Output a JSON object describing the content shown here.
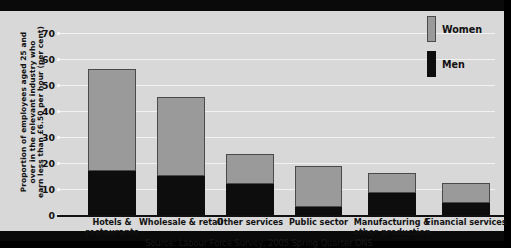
{
  "chart_data": {
    "type": "bar",
    "subtype": "stacked-bar",
    "title": "",
    "xlabel": "",
    "ylabel": "Proportion of employees aged 25 and\nover in the relevant industry who\nearn less than £6.50 per hour (per cent)",
    "ylim": [
      0,
      70
    ],
    "yticks": [
      0,
      10,
      20,
      30,
      40,
      50,
      60,
      70
    ],
    "ytick_labels": [
      "0",
      "10",
      "20",
      "30",
      "40",
      "50",
      "60",
      "70"
    ],
    "grid": true,
    "grid_axis": "y",
    "legend_position": "top-right",
    "categories": [
      "Hotels &\nrestaurants",
      "Wholesale & retail",
      "Other services",
      "Public sector",
      "Manufacturing &\nother production",
      "Financial services"
    ],
    "series": [
      {
        "name": "Men",
        "color": "#0d0d0d",
        "values": [
          17,
          15,
          12,
          3,
          8.5,
          4.5
        ]
      },
      {
        "name": "Women",
        "color": "#9a9a9a",
        "values": [
          39,
          30.5,
          11.5,
          16,
          7.5,
          7.8
        ]
      }
    ],
    "totals": [
      56,
      45.5,
      23.5,
      19,
      16,
      12.3
    ],
    "source": "Source: Labour Force Survey, 2005 Spring Quarter ONS",
    "colors": {
      "men": "#0d0d0d",
      "women": "#9a9a9a",
      "plot_background": "#d8d8d8",
      "gridline": "#f2f2f2",
      "frame": "#0a0a0a",
      "text": "#111111"
    }
  }
}
